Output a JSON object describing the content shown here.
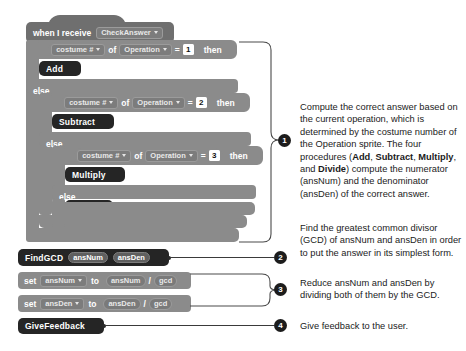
{
  "script": {
    "hat": {
      "keyword": "when I receive",
      "message": "CheckAnswer",
      "dropdown_icon": "caret-down-icon"
    },
    "conditions": [
      {
        "if_label": "if",
        "then_label": "else",
        "then_keyword": "then",
        "sensing": {
          "property": "costume #",
          "of_label": "of",
          "target": "Operation"
        },
        "operator": "=",
        "value": "1",
        "body_procedure": "Add"
      },
      {
        "if_label": "if",
        "then_label": "else",
        "then_keyword": "then",
        "sensing": {
          "property": "costume #",
          "of_label": "of",
          "target": "Operation"
        },
        "operator": "=",
        "value": "2",
        "body_procedure": "Subtract"
      },
      {
        "if_label": "if",
        "then_label": "else",
        "then_keyword": "then",
        "sensing": {
          "property": "costume #",
          "of_label": "of",
          "target": "Operation"
        },
        "operator": "=",
        "value": "3",
        "body_procedure": "Multiply",
        "else_procedure": "Divide"
      }
    ],
    "find_gcd": {
      "name": "FindGCD",
      "arg1": "ansNum",
      "arg2": "ansDen"
    },
    "set_num": {
      "set_label": "set",
      "variable": "ansNum",
      "to_label": "to",
      "operand_left": "ansNum",
      "operator": "/",
      "operand_right": "gcd"
    },
    "set_den": {
      "set_label": "set",
      "variable": "ansDen",
      "to_label": "to",
      "operand_left": "ansDen",
      "operator": "/",
      "operand_right": "gcd"
    },
    "give_feedback": {
      "name": "GiveFeedback"
    }
  },
  "callouts": [
    {
      "number": "1",
      "text_parts": [
        "Compute the correct answer based on the current operation, which is determined by the costume number of the Operation sprite. The four procedures (",
        "Add",
        ", ",
        "Subtract",
        ", ",
        "Multiply",
        ", and ",
        "Divide",
        ") compute the numerator (ansNum) and the denominator (ansDen) of the correct answer."
      ],
      "text": "Compute the correct answer based on the current operation, which is determined by the costume number of the Operation sprite. The four procedures (Add, Subtract, Multiply, and Divide) compute the numerator (ansNum) and the denominator (ansDen) of the correct answer."
    },
    {
      "number": "2",
      "text": "Find the greatest common divisor (GCD) of ansNum and ansDen in order to put the answer in its simplest form."
    },
    {
      "number": "3",
      "text": "Reduce ansNum and ansDen by dividing both of them by the GCD."
    },
    {
      "number": "4",
      "text": "Give feedback to the user."
    }
  ],
  "colors": {
    "control_block": "#8b8b8b",
    "event_block": "#6f6f6f",
    "custom_block": "#252525",
    "page_background": "#ffffff",
    "callout_marker": "#1c1c1c"
  }
}
